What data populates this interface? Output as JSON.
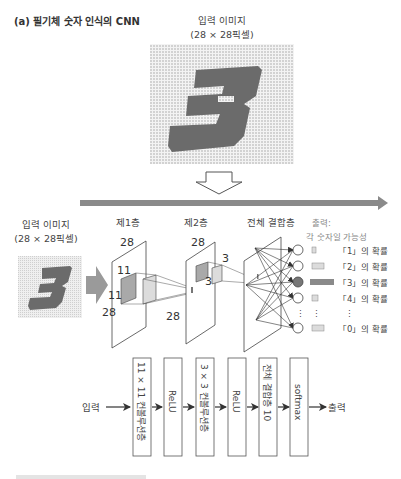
{
  "figure": {
    "title": "(a) 필기체 숫자 인식의 CNN",
    "top_image": {
      "label_line1": "입력 이미지",
      "label_line2": "(28 × 28픽셀)",
      "digit": "3"
    },
    "network": {
      "input_label_line1": "입력 이미지",
      "input_label_line2": "(28 × 28픽셀)",
      "layer1": {
        "title": "제1층",
        "width": "28",
        "height": "28",
        "kernel_w": "11",
        "kernel_h": "11"
      },
      "layer2": {
        "title": "제2층",
        "width": "28",
        "height": "28",
        "kernel_w": "3",
        "kernel_h": "3"
      },
      "fc": {
        "title": "전체 결합층"
      },
      "output": {
        "title_line1": "출력:",
        "title_line2": "각 숫자일 가능성",
        "items": [
          {
            "label": "「1」의 확률",
            "bar": 0.15,
            "active": false
          },
          {
            "label": "「2」의 확률",
            "bar": 0.5,
            "active": false
          },
          {
            "label": "「3」의 확률",
            "bar": 1.0,
            "active": true
          },
          {
            "label": "「4」의 확률",
            "bar": 0.25,
            "active": false
          },
          {
            "label": "「0」의 확률",
            "bar": 0.5,
            "active": false
          }
        ],
        "ellipsis": "⋮"
      }
    },
    "flow": {
      "input_label": "입력",
      "output_label": "출력",
      "blocks": [
        "11 × 11 컨볼루션층",
        "ReLU",
        "3 × 3 컨볼루션층",
        "ReLU",
        "전체 결합층 10",
        "softmax"
      ]
    },
    "colors": {
      "digit": "#6b6b6b",
      "grid_bg": "#e6e6e6",
      "banner_arrow": "#8a8a8a",
      "kernel_dark": "#a9a9a9",
      "kernel_light": "#dcdcdc",
      "active_node": "#777777"
    }
  }
}
